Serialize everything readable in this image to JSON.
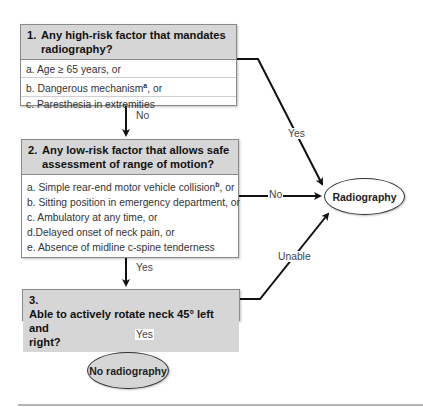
{
  "decision_1": {
    "number": "1.",
    "question": "Any high-risk factor that mandates radiography?",
    "question_lines": [
      "Any high-risk factor that mandates",
      "radiography?"
    ],
    "items": [
      {
        "letter": "a.",
        "text": "Age ≥ 65 years, or",
        "footnote": ""
      },
      {
        "letter": "b.",
        "text": "Dangerous mechanism",
        "footnote": "a",
        "suffix": ", or"
      },
      {
        "letter": "c.",
        "text": "Paresthesia in extremities",
        "footnote": ""
      }
    ]
  },
  "decision_2": {
    "number": "2.",
    "question": "Any low-risk factor that allows safe assessment of range of motion?",
    "question_lines": [
      "Any low-risk factor that allows safe",
      "assessment of range of motion?"
    ],
    "items": [
      {
        "letter": "a.",
        "text": "Simple rear-end motor vehicle collision",
        "footnote": "b",
        "suffix": ", or"
      },
      {
        "letter": "b.",
        "text": "Sitting position in emergency department, or",
        "footnote": ""
      },
      {
        "letter": "c.",
        "text": "Ambulatory at any time, or",
        "footnote": ""
      },
      {
        "letter": "d.",
        "text": "Delayed onset of neck pain, or",
        "footnote": ""
      },
      {
        "letter": "e.",
        "text": "Absence of midline c-spine tenderness",
        "footnote": ""
      }
    ]
  },
  "decision_3": {
    "number": "3.",
    "question": "Able to actively rotate neck 45° left and right?",
    "question_lines": [
      "Able to actively rotate neck 45° left and",
      "right?"
    ]
  },
  "outcomes": {
    "radiography": "Radiography",
    "no_radiography": "No radiography"
  },
  "edges": {
    "d1_to_d2": "No",
    "d1_to_radiography": "Yes",
    "d2_to_radiography": "No",
    "d2_to_d3": "Yes",
    "d3_to_radiography": "Unable",
    "d3_to_no_radiography": "Yes"
  },
  "colors": {
    "header_fill": "#d6d6d6",
    "border": "#8a8a8a",
    "line": "#111111"
  }
}
